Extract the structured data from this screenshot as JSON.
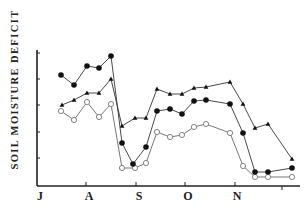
{
  "chart_data": {
    "type": "line",
    "title": "",
    "xlabel": "",
    "ylabel": "SOIL MOISTURE DEFICIT",
    "x_tick_labels": [
      "J",
      "A",
      "S",
      "O",
      "N"
    ],
    "y_tick_count": 5,
    "ylim": [
      0,
      5
    ],
    "grid": false,
    "legend": null,
    "x_units": "approximate day-of-season index (J=0, A=1, S=2, O=3, N=4 months)",
    "x": [
      0.49,
      0.75,
      1.01,
      1.25,
      1.5,
      1.72,
      1.94,
      2.2,
      2.42,
      2.68,
      2.93,
      3.17,
      3.41,
      3.9,
      4.16,
      4.4,
      4.66,
      5.14
    ],
    "series": [
      {
        "name": "filled-circles",
        "marker": "filled-circle",
        "values": [
          4.2,
          3.8,
          4.5,
          4.5,
          4.9,
          1.6,
          0.8,
          1.5,
          2.8,
          2.9,
          2.7,
          3.2,
          3.3,
          3.1,
          2.0,
          0.5,
          0.5,
          0.7
        ]
      },
      {
        "name": "triangles",
        "marker": "filled-triangle",
        "values": [
          3.1,
          3.2,
          3.5,
          3.5,
          4.0,
          2.3,
          2.6,
          2.6,
          3.7,
          3.5,
          3.5,
          3.7,
          3.7,
          3.9,
          3.1,
          2.2,
          2.3,
          1.0
        ]
      },
      {
        "name": "open-circles",
        "marker": "open-circle",
        "values": [
          2.8,
          2.5,
          3.2,
          2.6,
          3.1,
          0.7,
          0.7,
          0.9,
          2.0,
          1.8,
          1.9,
          2.2,
          2.3,
          2.0,
          0.8,
          0.3,
          0.3,
          0.3
        ]
      }
    ]
  },
  "axes": {
    "y_label": "SOIL MOISTURE DEFICIT",
    "x_labels": [
      {
        "label": "J",
        "x": 40
      },
      {
        "label": "A",
        "x": 89
      },
      {
        "label": "S",
        "x": 139
      },
      {
        "label": "O",
        "x": 188
      },
      {
        "label": "N",
        "x": 237
      }
    ]
  },
  "plot_px": {
    "filled": [
      [
        61,
        75
      ],
      [
        74,
        85
      ],
      [
        87,
        66
      ],
      [
        99,
        68
      ],
      [
        111,
        56
      ],
      [
        122,
        143
      ],
      [
        133,
        164
      ],
      [
        146,
        147
      ],
      [
        157,
        111
      ],
      [
        170,
        109
      ],
      [
        182,
        114
      ],
      [
        194,
        101
      ],
      [
        206,
        100
      ],
      [
        230,
        104
      ],
      [
        243,
        133
      ],
      [
        255,
        172
      ],
      [
        268,
        172
      ],
      [
        292,
        168
      ]
    ],
    "triangles": [
      [
        62,
        105
      ],
      [
        74,
        100
      ],
      [
        87,
        93
      ],
      [
        99,
        93
      ],
      [
        111,
        79
      ],
      [
        122,
        126
      ],
      [
        135,
        118
      ],
      [
        146,
        118
      ],
      [
        157,
        89
      ],
      [
        170,
        94
      ],
      [
        182,
        94
      ],
      [
        194,
        88
      ],
      [
        206,
        87
      ],
      [
        230,
        82
      ],
      [
        243,
        104
      ],
      [
        255,
        128
      ],
      [
        268,
        124
      ],
      [
        292,
        159
      ]
    ],
    "open": [
      [
        61,
        111
      ],
      [
        74,
        120
      ],
      [
        87,
        102
      ],
      [
        99,
        117
      ],
      [
        111,
        104
      ],
      [
        122,
        168
      ],
      [
        135,
        168
      ],
      [
        146,
        163
      ],
      [
        157,
        132
      ],
      [
        170,
        137
      ],
      [
        182,
        135
      ],
      [
        194,
        127
      ],
      [
        206,
        124
      ],
      [
        230,
        133
      ],
      [
        243,
        166
      ],
      [
        255,
        177
      ],
      [
        268,
        177
      ],
      [
        292,
        177
      ]
    ]
  }
}
